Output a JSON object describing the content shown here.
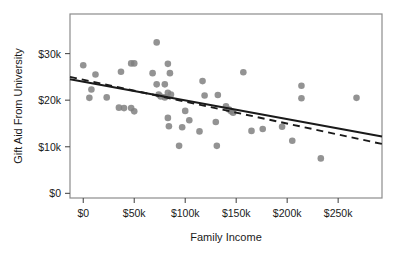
{
  "chart_data": {
    "type": "scatter",
    "title": "",
    "xlabel": "Family Income",
    "ylabel": "Gift Aid From University",
    "xlim": [
      -13000,
      293000
    ],
    "ylim": [
      -1000,
      38500
    ],
    "grid": false,
    "legend": "none",
    "xticks": [
      0,
      50000,
      100000,
      150000,
      200000,
      250000
    ],
    "xticklabels": [
      "$0",
      "$50k",
      "$100k",
      "$150k",
      "$200k",
      "$250k"
    ],
    "yticks": [
      0,
      10000,
      20000,
      30000
    ],
    "yticklabels": [
      "$0",
      "$10k",
      "$20k",
      "$30k"
    ],
    "point_color": "#808080",
    "line_color": "#1a1a1a",
    "points": [
      {
        "x": 0,
        "y": 27500
      },
      {
        "x": 12000,
        "y": 25500
      },
      {
        "x": 8000,
        "y": 22300
      },
      {
        "x": 6000,
        "y": 20500
      },
      {
        "x": 23000,
        "y": 20600
      },
      {
        "x": 37000,
        "y": 26100
      },
      {
        "x": 35000,
        "y": 18400
      },
      {
        "x": 40000,
        "y": 18300
      },
      {
        "x": 47000,
        "y": 27900
      },
      {
        "x": 50000,
        "y": 27900
      },
      {
        "x": 47000,
        "y": 18300
      },
      {
        "x": 50000,
        "y": 17600
      },
      {
        "x": 68000,
        "y": 25800
      },
      {
        "x": 72000,
        "y": 32400
      },
      {
        "x": 72000,
        "y": 23400
      },
      {
        "x": 80000,
        "y": 23400
      },
      {
        "x": 83000,
        "y": 27800
      },
      {
        "x": 85000,
        "y": 25800
      },
      {
        "x": 74000,
        "y": 21200
      },
      {
        "x": 76000,
        "y": 20800
      },
      {
        "x": 80000,
        "y": 20600
      },
      {
        "x": 83000,
        "y": 21600
      },
      {
        "x": 86000,
        "y": 21200
      },
      {
        "x": 83000,
        "y": 16200
      },
      {
        "x": 84000,
        "y": 14400
      },
      {
        "x": 94000,
        "y": 10200
      },
      {
        "x": 97000,
        "y": 14200
      },
      {
        "x": 100000,
        "y": 17700
      },
      {
        "x": 104000,
        "y": 15700
      },
      {
        "x": 114000,
        "y": 13300
      },
      {
        "x": 117000,
        "y": 24100
      },
      {
        "x": 119000,
        "y": 21000
      },
      {
        "x": 132000,
        "y": 21100
      },
      {
        "x": 130000,
        "y": 15300
      },
      {
        "x": 131000,
        "y": 10200
      },
      {
        "x": 140000,
        "y": 18700
      },
      {
        "x": 143000,
        "y": 18000
      },
      {
        "x": 145000,
        "y": 17600
      },
      {
        "x": 147000,
        "y": 17300
      },
      {
        "x": 157000,
        "y": 26000
      },
      {
        "x": 165000,
        "y": 13400
      },
      {
        "x": 176000,
        "y": 13800
      },
      {
        "x": 195000,
        "y": 14300
      },
      {
        "x": 205000,
        "y": 11300
      },
      {
        "x": 214000,
        "y": 23100
      },
      {
        "x": 214000,
        "y": 20400
      },
      {
        "x": 233000,
        "y": 7500
      },
      {
        "x": 268000,
        "y": 20500
      }
    ],
    "trend_lines": [
      {
        "name": "solid-fit-line",
        "style": "solid",
        "x_start": -13000,
        "y_start": 24500,
        "x_end": 293000,
        "y_end": 12200
      },
      {
        "name": "dashed-fit-line",
        "style": "dashed",
        "x_start": -13000,
        "y_start": 25000,
        "x_end": 293000,
        "y_end": 10600
      }
    ]
  }
}
